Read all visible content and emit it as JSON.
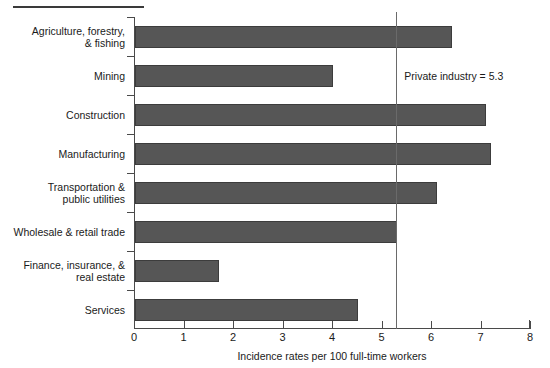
{
  "chart_data": {
    "type": "bar",
    "orientation": "horizontal",
    "title": "",
    "xlabel": "Incidence rates per 100 full-time workers",
    "ylabel": "",
    "xlim": [
      0,
      8
    ],
    "xticks": [
      "0",
      "1",
      "2",
      "3",
      "4",
      "5",
      "6",
      "7",
      "8"
    ],
    "grid": false,
    "legend": null,
    "categories": [
      "Agriculture, forestry,\n& fishing",
      "Mining",
      "Construction",
      "Manufacturing",
      "Transportation &\npublic utilities",
      "Wholesale & retail trade",
      "Finance, insurance, &\nreal estate",
      "Services"
    ],
    "values": [
      6.4,
      4.0,
      7.1,
      7.2,
      6.1,
      5.3,
      1.7,
      4.5
    ],
    "bars": [
      {
        "label_line1": "Agriculture, forestry,",
        "label_line2": "& fishing",
        "value": 6.4
      },
      {
        "label_line1": "Mining",
        "label_line2": "",
        "value": 4.0
      },
      {
        "label_line1": "Construction",
        "label_line2": "",
        "value": 7.1
      },
      {
        "label_line1": "Manufacturing",
        "label_line2": "",
        "value": 7.2
      },
      {
        "label_line1": "Transportation &",
        "label_line2": "public utilities",
        "value": 6.1
      },
      {
        "label_line1": "Wholesale & retail trade",
        "label_line2": "",
        "value": 5.3
      },
      {
        "label_line1": "Finance, insurance, &",
        "label_line2": "real estate",
        "value": 1.7
      },
      {
        "label_line1": "Services",
        "label_line2": "",
        "value": 4.5
      }
    ],
    "annotations": [
      {
        "name": "private-industry-reference",
        "text": "Private industry = 5.3",
        "value": 5.3
      }
    ],
    "colors": {
      "bar_fill": "#565656",
      "bar_edge": "#3c3c3c",
      "axis": "#4a4a4a",
      "reference_line": "#6a6a6a",
      "text": "#1a1a1a",
      "background": "#ffffff"
    }
  }
}
